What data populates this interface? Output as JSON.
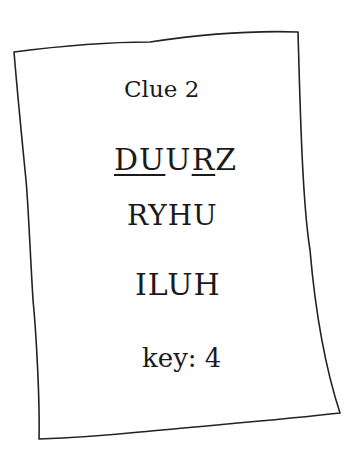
{
  "clue": {
    "title": "Clue 2",
    "words": [
      {
        "text": "DUURZ",
        "letters": [
          {
            "char": "D",
            "underlined": true
          },
          {
            "char": "U",
            "underlined": true
          },
          {
            "char": "U",
            "underlined": false
          },
          {
            "char": "R",
            "underlined": true
          },
          {
            "char": "Z",
            "underlined": false
          }
        ]
      },
      {
        "text": "RYHU"
      },
      {
        "text": "ILUH"
      }
    ],
    "key": "key: 4"
  },
  "colors": {
    "ink": "#1a1a1a",
    "paper": "#ffffff"
  }
}
